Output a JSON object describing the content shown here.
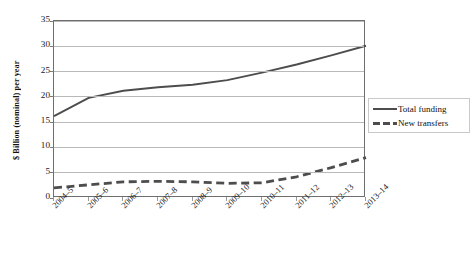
{
  "chart_data": {
    "type": "line",
    "title": "",
    "xlabel": "",
    "ylabel": "$ Billion (nominal) per year",
    "categories": [
      "2004–5",
      "2005–6",
      "2006–7",
      "2007–8",
      "2008–9",
      "2009–10",
      "2010–11",
      "2011–12",
      "2012–13",
      "2013–14"
    ],
    "ylim": [
      0,
      35
    ],
    "ytick_values": [
      0,
      5,
      10,
      15,
      20,
      25,
      30,
      35
    ],
    "ytick_labels": [
      "0",
      "5",
      "10",
      "15",
      "20",
      "25",
      "30",
      "35"
    ],
    "grid": "horizontal",
    "legend_position": "right",
    "series": [
      {
        "name": "Total funding",
        "style": "solid",
        "color": "#4d4d4d",
        "values": [
          16.2,
          19.8,
          21.2,
          21.9,
          22.4,
          23.3,
          24.8,
          26.4,
          28.2,
          30.1
        ]
      },
      {
        "name": "New transfers",
        "style": "dashed",
        "color": "#4d4d4d",
        "values": [
          2.0,
          2.6,
          3.2,
          3.3,
          3.2,
          2.9,
          3.0,
          4.2,
          6.0,
          8.0
        ]
      }
    ]
  },
  "legend": {
    "items": [
      {
        "label": "Total funding",
        "swatch": "solid-line-swatch"
      },
      {
        "label": "New transfers",
        "swatch": "dashed-line-swatch"
      }
    ]
  }
}
